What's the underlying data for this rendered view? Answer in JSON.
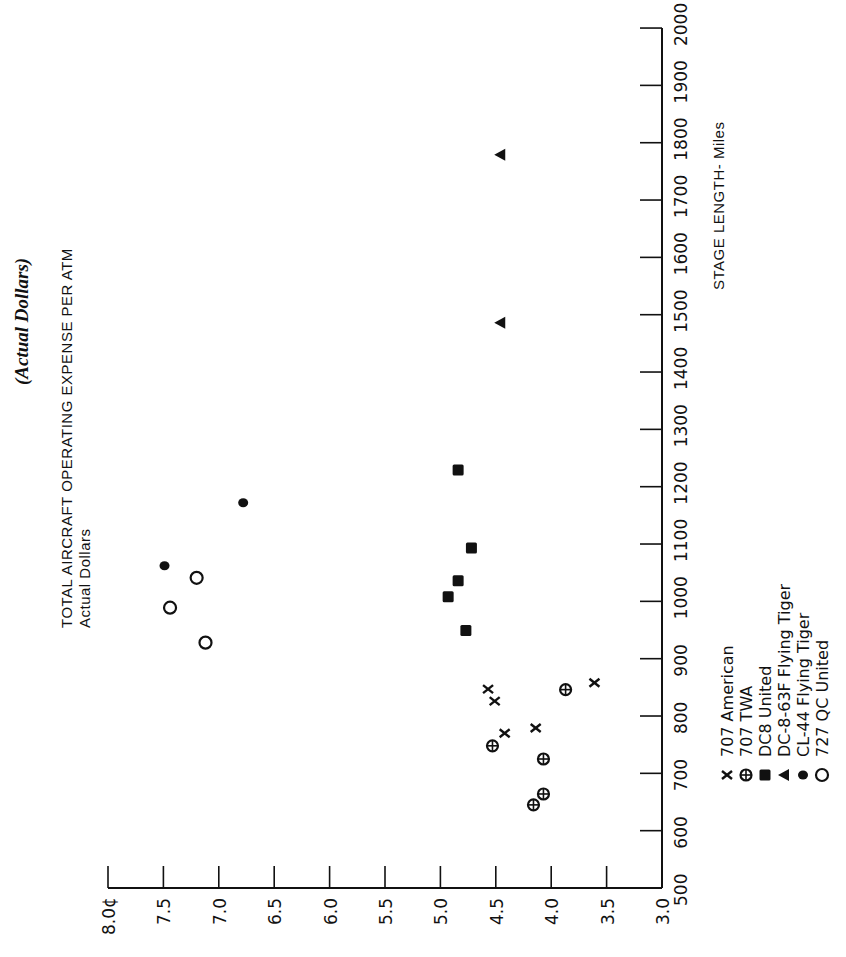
{
  "page": {
    "subtitle": "(Actual Dollars)",
    "y_axis_title": "TOTAL AIRCRAFT OPERATING EXPENSE PER ATM",
    "y_axis_subtitle": "Actual Dollars",
    "x_axis_title": "STAGE LENGTH- Miles"
  },
  "legend": [
    {
      "symbol": "x",
      "icon": "x-cross-icon",
      "label": "707 American"
    },
    {
      "symbol": "circle-plus",
      "icon": "circle-plus-icon",
      "label": "707 TWA"
    },
    {
      "symbol": "square",
      "icon": "filled-square-icon",
      "label": "DC8 United"
    },
    {
      "symbol": "triangle",
      "icon": "filled-triangle-icon",
      "label": "DC-8-63F Flying Tiger"
    },
    {
      "symbol": "dot",
      "icon": "filled-circle-icon",
      "label": "CL-44 Flying Tiger"
    },
    {
      "symbol": "circle",
      "icon": "open-circle-icon",
      "label": "727 QC United"
    }
  ],
  "chart_data": {
    "type": "scatter",
    "title": "(Actual Dollars)",
    "orientation_note": "figure is rotated 90° counter-clockwise on the page",
    "xlabel": "STAGE LENGTH- Miles",
    "ylabel": "TOTAL AIRCRAFT OPERATING EXPENSE PER ATM (Actual Dollars)",
    "xlim": [
      500,
      2000
    ],
    "ylim": [
      3.0,
      8.0
    ],
    "x_ticks": [
      "500",
      "600",
      "700",
      "800",
      "900",
      "1000",
      "1100",
      "1200",
      "1300",
      "1400",
      "1500",
      "1600",
      "1700",
      "1800",
      "1900",
      "2000"
    ],
    "y_ticks": [
      "3.0",
      "3.5",
      "4.0",
      "4.5",
      "5.0",
      "5.5",
      "6.0",
      "6.5",
      "7.0",
      "7.5",
      "8.0¢"
    ],
    "grid": false,
    "legend_position": "below-right (rotated)",
    "series": [
      {
        "name": "707 American",
        "marker": "x",
        "points": [
          [
            847,
            4.57
          ],
          [
            826,
            4.51
          ],
          [
            770,
            4.42
          ],
          [
            779,
            4.14
          ],
          [
            858,
            3.61
          ]
        ]
      },
      {
        "name": "707 TWA",
        "marker": "circle-plus",
        "points": [
          [
            846,
            3.87
          ],
          [
            748,
            4.53
          ],
          [
            725,
            4.07
          ],
          [
            664,
            4.07
          ],
          [
            645,
            4.16
          ]
        ]
      },
      {
        "name": "DC8 United",
        "marker": "square",
        "points": [
          [
            1229,
            4.84
          ],
          [
            1093,
            4.72
          ],
          [
            1036,
            4.84
          ],
          [
            1008,
            4.93
          ],
          [
            949,
            4.77
          ]
        ]
      },
      {
        "name": "DC-8-63F Flying Tiger",
        "marker": "triangle",
        "points": [
          [
            1779,
            4.46
          ],
          [
            1486,
            4.46
          ]
        ]
      },
      {
        "name": "CL-44 Flying Tiger",
        "marker": "dot",
        "points": [
          [
            1062,
            7.49
          ],
          [
            1172,
            6.78
          ]
        ]
      },
      {
        "name": "727 QC United",
        "marker": "circle",
        "points": [
          [
            1041,
            7.2
          ],
          [
            989,
            7.44
          ],
          [
            928,
            7.12
          ]
        ]
      }
    ]
  }
}
